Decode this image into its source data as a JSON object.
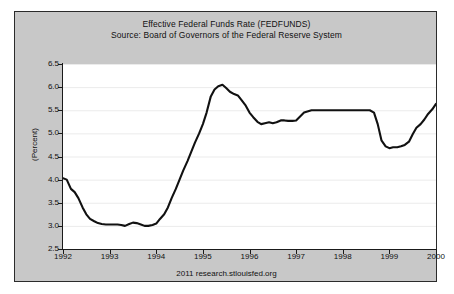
{
  "chart_data": {
    "type": "line",
    "title": "Effective Federal Funds Rate (FEDFUNDS)",
    "subtitle": "Source: Board of Governors of the Federal Reserve System",
    "xlabel": "",
    "ylabel": "(Percent)",
    "xlim": [
      1992.0,
      2000.0
    ],
    "ylim": [
      2.5,
      6.5
    ],
    "ytick_labels": [
      "6.5",
      "6.0",
      "5.5",
      "5.0",
      "4.5",
      "4.0",
      "3.5",
      "3.0",
      "2.5"
    ],
    "ytick_values": [
      6.5,
      6.0,
      5.5,
      5.0,
      4.5,
      4.0,
      3.5,
      3.0,
      2.5
    ],
    "xtick_labels": [
      "1992",
      "1993",
      "1994",
      "1995",
      "1996",
      "1997",
      "1998",
      "1999",
      "2000"
    ],
    "xtick_values": [
      1992,
      1993,
      1994,
      1995,
      1996,
      1997,
      1998,
      1999,
      2000
    ],
    "grid": true,
    "grid_axis": "y",
    "legend": false,
    "line_color": "#111111",
    "grid_color": "#ebebeb",
    "plot_background": "#ffffff",
    "panel_background": "#c8c8c8",
    "series": [
      {
        "name": "FEDFUNDS",
        "x": [
          1992.0,
          1992.08,
          1992.17,
          1992.25,
          1992.33,
          1992.42,
          1992.5,
          1992.58,
          1992.67,
          1992.75,
          1992.83,
          1992.92,
          1993.0,
          1993.08,
          1993.17,
          1993.25,
          1993.33,
          1993.42,
          1993.5,
          1993.58,
          1993.67,
          1993.75,
          1993.83,
          1993.92,
          1994.0,
          1994.08,
          1994.17,
          1994.25,
          1994.33,
          1994.42,
          1994.5,
          1994.58,
          1994.67,
          1994.75,
          1994.83,
          1994.92,
          1995.0,
          1995.08,
          1995.17,
          1995.25,
          1995.33,
          1995.42,
          1995.5,
          1995.58,
          1995.67,
          1995.75,
          1995.83,
          1995.92,
          1996.0,
          1996.08,
          1996.17,
          1996.25,
          1996.33,
          1996.42,
          1996.5,
          1996.58,
          1996.67,
          1996.75,
          1996.83,
          1996.92,
          1997.0,
          1997.17,
          1997.33,
          1997.5,
          1997.67,
          1997.83,
          1998.0,
          1998.17,
          1998.33,
          1998.5,
          1998.58,
          1998.67,
          1998.75,
          1998.83,
          1998.92,
          1999.0,
          1999.08,
          1999.17,
          1999.25,
          1999.33,
          1999.42,
          1999.5,
          1999.58,
          1999.67,
          1999.75,
          1999.83,
          1999.92,
          2000.0
        ],
        "values": [
          4.03,
          4.0,
          3.8,
          3.73,
          3.6,
          3.4,
          3.25,
          3.15,
          3.1,
          3.06,
          3.04,
          3.03,
          3.03,
          3.03,
          3.03,
          3.02,
          3.0,
          3.04,
          3.07,
          3.06,
          3.03,
          3.0,
          3.0,
          3.02,
          3.05,
          3.15,
          3.25,
          3.4,
          3.6,
          3.8,
          4.0,
          4.2,
          4.4,
          4.6,
          4.8,
          5.0,
          5.2,
          5.45,
          5.8,
          5.95,
          6.02,
          6.05,
          5.98,
          5.9,
          5.85,
          5.82,
          5.72,
          5.6,
          5.45,
          5.35,
          5.25,
          5.2,
          5.22,
          5.24,
          5.22,
          5.24,
          5.28,
          5.28,
          5.27,
          5.27,
          5.28,
          5.45,
          5.5,
          5.5,
          5.5,
          5.5,
          5.5,
          5.5,
          5.5,
          5.5,
          5.5,
          5.45,
          5.2,
          4.85,
          4.72,
          4.68,
          4.7,
          4.7,
          4.72,
          4.75,
          4.82,
          4.98,
          5.12,
          5.2,
          5.3,
          5.42,
          5.52,
          5.64
        ]
      }
    ],
    "annotations": [
      {
        "text": "2011 research.stlouisfed.org",
        "position": "bottom-center"
      }
    ]
  },
  "footer": {
    "source": "2011 research.stlouisfed.org"
  }
}
